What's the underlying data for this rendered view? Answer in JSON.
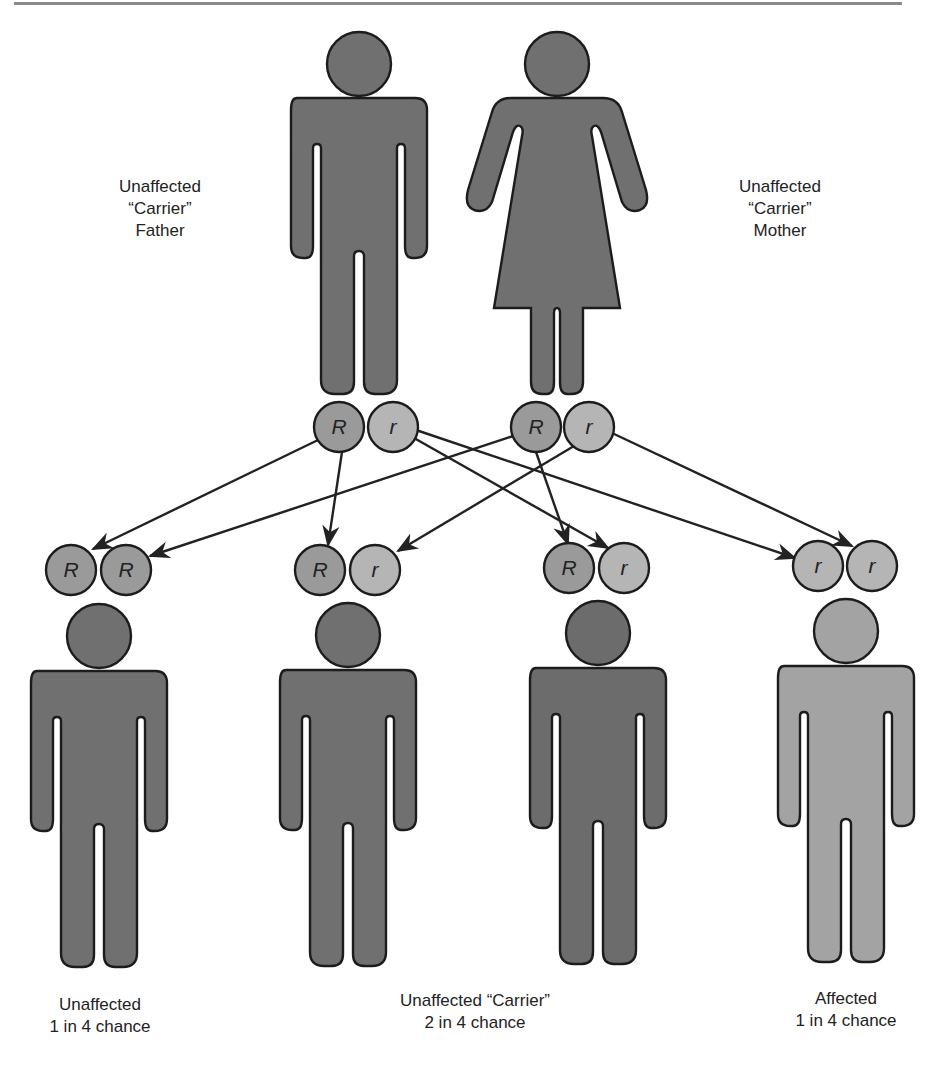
{
  "colors": {
    "figure_dark": "#707070",
    "figure_affected": "#a3a3a3",
    "allele_dominant": "#9a9a9a",
    "allele_recessive": "#b5b5b5",
    "outline": "#1c1c1c",
    "arrow": "#222222",
    "text": "#222222"
  },
  "parents": [
    {
      "id": "father",
      "sex": "male",
      "label_lines": [
        "Unaffected",
        "“Carrier”",
        "Father"
      ],
      "alleles": [
        "R",
        "r"
      ]
    },
    {
      "id": "mother",
      "sex": "female",
      "label_lines": [
        "Unaffected",
        "“Carrier”",
        "Mother"
      ],
      "alleles": [
        "R",
        "r"
      ]
    }
  ],
  "children": [
    {
      "id": "child-1",
      "alleles": [
        "R",
        "R"
      ],
      "status": "unaffected"
    },
    {
      "id": "child-2",
      "alleles": [
        "R",
        "r"
      ],
      "status": "carrier"
    },
    {
      "id": "child-3",
      "alleles": [
        "R",
        "r"
      ],
      "status": "carrier"
    },
    {
      "id": "child-4",
      "alleles": [
        "r",
        "r"
      ],
      "status": "affected"
    }
  ],
  "outcome_labels": [
    {
      "id": "unaffected",
      "lines": [
        "Unaffected",
        "1 in 4 chance"
      ]
    },
    {
      "id": "carrier",
      "lines": [
        "Unaffected “Carrier”",
        "2 in 4 chance"
      ]
    },
    {
      "id": "affected",
      "lines": [
        "Affected",
        "1 in 4 chance"
      ]
    }
  ],
  "arrows": [
    {
      "from": "father.R",
      "to": "child-1.a1"
    },
    {
      "from": "father.R",
      "to": "child-2.a1"
    },
    {
      "from": "father.r",
      "to": "child-3.a2"
    },
    {
      "from": "father.r",
      "to": "child-4.a1"
    },
    {
      "from": "mother.R",
      "to": "child-1.a2"
    },
    {
      "from": "mother.R",
      "to": "child-3.a1"
    },
    {
      "from": "mother.r",
      "to": "child-2.a2"
    },
    {
      "from": "mother.r",
      "to": "child-4.a2"
    }
  ]
}
